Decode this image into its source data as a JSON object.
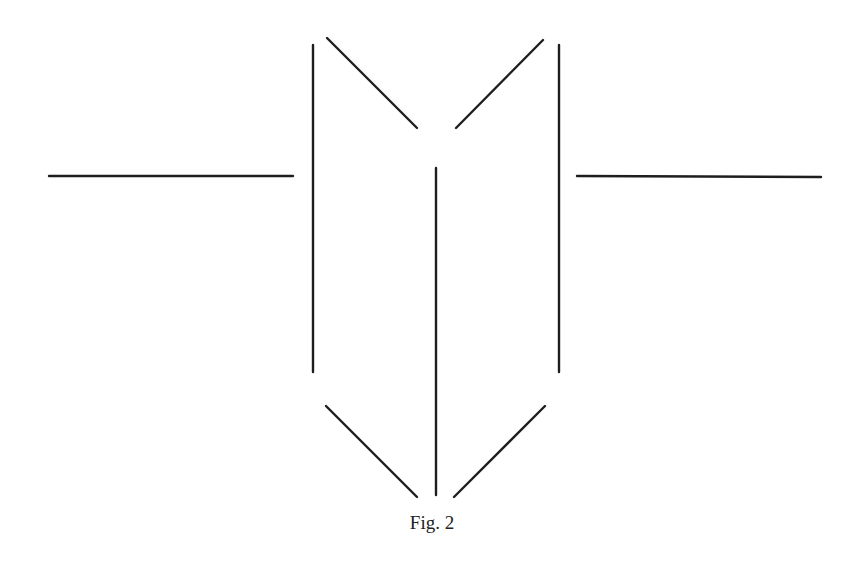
{
  "figure": {
    "caption": "Fig. 2",
    "stroke_color": "#1e1e1e",
    "stroke_width": 2.4,
    "lines": [
      {
        "name": "left-horizontal-lead",
        "x1": 49,
        "y1": 176,
        "x2": 293,
        "y2": 176
      },
      {
        "name": "right-horizontal-lead",
        "x1": 577,
        "y1": 176,
        "x2": 821,
        "y2": 177
      },
      {
        "name": "left-vertical-plate",
        "x1": 313,
        "y1": 45,
        "x2": 313,
        "y2": 372
      },
      {
        "name": "right-vertical-plate",
        "x1": 559,
        "y1": 45,
        "x2": 559,
        "y2": 372
      },
      {
        "name": "center-vertical-line",
        "x1": 436,
        "y1": 168,
        "x2": 436,
        "y2": 495
      },
      {
        "name": "upper-left-diagonal",
        "x1": 327,
        "y1": 38,
        "x2": 417,
        "y2": 128
      },
      {
        "name": "upper-right-diagonal",
        "x1": 543,
        "y1": 40,
        "x2": 456,
        "y2": 128
      },
      {
        "name": "lower-left-diagonal",
        "x1": 326,
        "y1": 406,
        "x2": 417,
        "y2": 497
      },
      {
        "name": "lower-right-diagonal",
        "x1": 545,
        "y1": 406,
        "x2": 454,
        "y2": 497
      }
    ]
  }
}
